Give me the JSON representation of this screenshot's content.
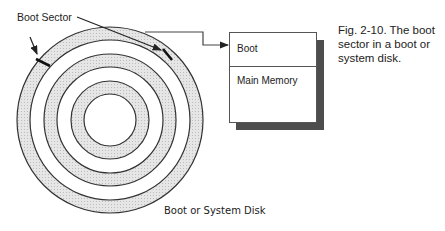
{
  "labels": {
    "boot_sector": "Boot Sector",
    "disk_caption": "Boot or System Disk"
  },
  "memory": {
    "rows": [
      "Boot",
      "Main Memory"
    ]
  },
  "figure_caption": {
    "lines": [
      "Fig. 2-10.  The boot",
      "sector in a boot or",
      "system disk."
    ]
  },
  "colors": {
    "band_fill": "#dcdcdc",
    "line": "#333333",
    "shadow": "#4d4d4d"
  }
}
